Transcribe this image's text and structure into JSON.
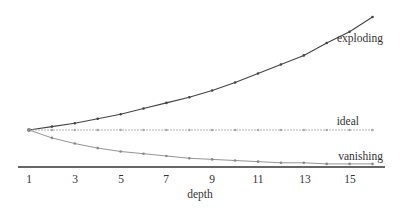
{
  "chart_data": {
    "type": "line",
    "title": "",
    "xlabel": "depth",
    "ylabel": "",
    "x": [
      1,
      2,
      3,
      4,
      5,
      6,
      7,
      8,
      9,
      10,
      11,
      12,
      13,
      14,
      15,
      16
    ],
    "xticks": [
      1,
      3,
      5,
      7,
      9,
      11,
      13,
      15
    ],
    "xlim": [
      1,
      16
    ],
    "grid": false,
    "legend_position": "inline-right",
    "series": [
      {
        "name": "exploding",
        "color": "#444444",
        "values": [
          1.0,
          1.03,
          1.06,
          1.1,
          1.14,
          1.19,
          1.24,
          1.29,
          1.35,
          1.42,
          1.5,
          1.58,
          1.66,
          1.77,
          1.87,
          2.0
        ]
      },
      {
        "name": "ideal",
        "color": "#aaaaaa",
        "values": [
          1.0,
          1.0,
          1.0,
          1.0,
          1.0,
          1.0,
          1.0,
          1.0,
          1.0,
          1.0,
          1.0,
          1.0,
          1.0,
          1.0,
          1.0,
          1.0
        ]
      },
      {
        "name": "vanishing",
        "color": "#888888",
        "values": [
          1.0,
          0.93,
          0.88,
          0.84,
          0.81,
          0.79,
          0.77,
          0.75,
          0.74,
          0.73,
          0.72,
          0.71,
          0.71,
          0.7,
          0.7,
          0.7
        ]
      }
    ],
    "annotations": [
      "exploding",
      "ideal",
      "vanishing"
    ]
  },
  "labels": {
    "xlabel": "depth",
    "xticks": [
      "1",
      "3",
      "5",
      "7",
      "9",
      "11",
      "13",
      "15"
    ],
    "exploding": "exploding",
    "ideal": "ideal",
    "vanishing": "vanishing"
  }
}
